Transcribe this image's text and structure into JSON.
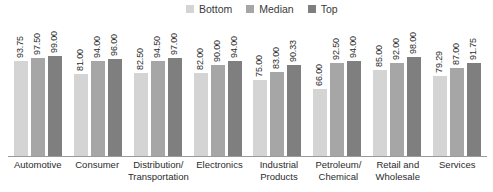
{
  "legend": {
    "position": "top-center",
    "items": [
      {
        "label": "Bottom",
        "color": "#d4d4d4"
      },
      {
        "label": "Median",
        "color": "#a6a6a6"
      },
      {
        "label": "Top",
        "color": "#7f7f7f"
      }
    ]
  },
  "chart_data": {
    "type": "bar",
    "title": "",
    "subtitle": "",
    "xlabel": "",
    "ylabel": "",
    "ylim": [
      0,
      100
    ],
    "grid": false,
    "legend_position": "top-center",
    "value_label_format": "0.00",
    "value_labels_rotated": true,
    "categories": [
      "Automotive",
      "Consumer",
      "Distribution/ Transportation",
      "Electronics",
      "Industrial Products",
      "Petroleum/ Chemical",
      "Retail and Wholesale",
      "Services"
    ],
    "series": [
      {
        "name": "Bottom",
        "color": "#d4d4d4",
        "values": [
          93.75,
          81.0,
          82.5,
          82.0,
          75.0,
          66.0,
          85.0,
          79.29
        ],
        "labels": [
          "93.75",
          "81.00",
          "82.50",
          "82.00",
          "75.00",
          "66.00",
          "85.00",
          "79.29"
        ]
      },
      {
        "name": "Median",
        "color": "#a6a6a6",
        "values": [
          97.5,
          94.0,
          94.5,
          90.0,
          83.0,
          92.5,
          92.0,
          87.0
        ],
        "labels": [
          "97.50",
          "94.00",
          "94.50",
          "90.00",
          "83.00",
          "92.50",
          "92.00",
          "87.00"
        ]
      },
      {
        "name": "Top",
        "color": "#7f7f7f",
        "values": [
          99.0,
          96.0,
          97.0,
          94.0,
          90.33,
          94.0,
          98.0,
          91.75
        ],
        "labels": [
          "99.00",
          "96.00",
          "97.00",
          "94.00",
          "90.33",
          "94.00",
          "98.00",
          "91.75"
        ]
      }
    ]
  },
  "axis": {
    "baseline_color": "#9a9a9a"
  }
}
